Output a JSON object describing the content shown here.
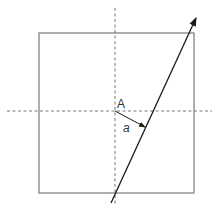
{
  "diagram": {
    "labels": {
      "point": "A",
      "distance": "a"
    },
    "colors": {
      "square": "#7a7a7a",
      "axes": "#666666",
      "line": "#1a1a1a",
      "text": "#333333"
    },
    "elements": {
      "square": {
        "x": 39,
        "y": 33,
        "width": 155,
        "height": 160
      },
      "horizontal_axis": {
        "x1": 7,
        "y1": 111,
        "x2": 212,
        "y2": 111,
        "style": "dashed"
      },
      "vertical_axis": {
        "x1": 115,
        "y1": 8,
        "x2": 115,
        "y2": 205,
        "style": "dashed"
      },
      "directed_line": {
        "x1": 111,
        "y1": 203,
        "x2": 196,
        "y2": 17,
        "arrow": "end"
      },
      "perpendicular_arrow": {
        "x1": 115,
        "y1": 111,
        "x2": 146,
        "y2": 127,
        "arrow": "end"
      },
      "point_A": {
        "x": 115,
        "y": 111
      }
    }
  }
}
